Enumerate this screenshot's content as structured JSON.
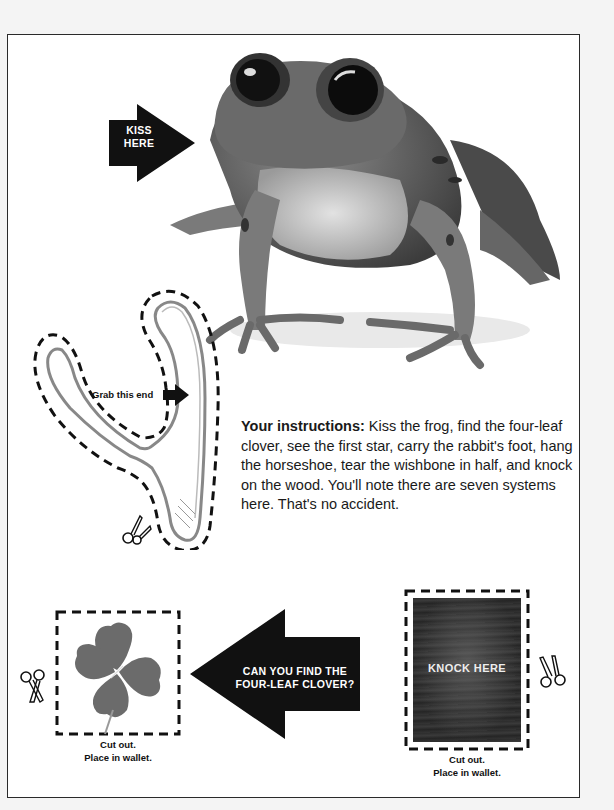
{
  "kiss_arrow": {
    "label_line1": "KISS",
    "label_line2": "HERE"
  },
  "wishbone": {
    "grab_label": "Grab this end"
  },
  "instructions": {
    "lead": "Your instructions:",
    "body": " Kiss the frog, find the four-leaf clover, see the first star, carry the rabbit's foot, hang the horseshoe, tear the wishbone in half, and knock on the wood. You'll note there are seven systems here. That's no accident."
  },
  "clover": {
    "caption_line1": "Cut out.",
    "caption_line2": "Place in wallet."
  },
  "clover_arrow": {
    "label_line1": "CAN YOU FIND THE",
    "label_line2": "FOUR-LEAF CLOVER?"
  },
  "wood": {
    "label": "KNOCK HERE",
    "caption_line1": "Cut out.",
    "caption_line2": "Place in wallet."
  },
  "icons": {
    "arrow": "arrow-right-icon",
    "scissors": "scissors-icon"
  },
  "colors": {
    "ink": "#111111",
    "page": "#ffffff",
    "border": "#2a2a2a",
    "wood": "#2a2a2a"
  }
}
